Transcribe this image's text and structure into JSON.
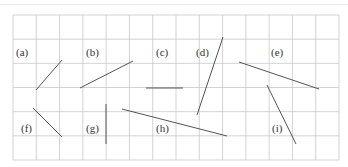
{
  "grid": {
    "x0": 13,
    "y0": 15,
    "x1": 339,
    "y1": 160,
    "cols": 14,
    "rows": 6,
    "line_color": "#c8c8c8"
  },
  "segment_color": "#555555",
  "label_color": "#333333",
  "segments": [
    {
      "label": "(a)",
      "label_x": 16,
      "label_y": 56,
      "x1": 62,
      "y1": 60,
      "x2": 36,
      "y2": 90
    },
    {
      "label": "(b)",
      "label_x": 86,
      "label_y": 56,
      "x1": 133,
      "y1": 61,
      "x2": 80,
      "y2": 88
    },
    {
      "label": "(c)",
      "label_x": 156,
      "label_y": 56,
      "x1": 146,
      "y1": 88,
      "x2": 183,
      "y2": 88
    },
    {
      "label": "(d)",
      "label_x": 196,
      "label_y": 56,
      "x1": 223,
      "y1": 37,
      "x2": 197,
      "y2": 115
    },
    {
      "label": "(e)",
      "label_x": 271,
      "label_y": 56,
      "x1": 239,
      "y1": 62,
      "x2": 319,
      "y2": 89
    },
    {
      "label": "(f)",
      "label_x": 21,
      "label_y": 132,
      "x1": 33,
      "y1": 108,
      "x2": 62,
      "y2": 137
    },
    {
      "label": "(g)",
      "label_x": 86,
      "label_y": 132,
      "x1": 106,
      "y1": 104,
      "x2": 106,
      "y2": 144
    },
    {
      "label": "(h)",
      "label_x": 156,
      "label_y": 132,
      "x1": 122,
      "y1": 109,
      "x2": 227,
      "y2": 136
    },
    {
      "label": "(i)",
      "label_x": 272,
      "label_y": 132,
      "x1": 267,
      "y1": 85,
      "x2": 296,
      "y2": 144
    }
  ]
}
